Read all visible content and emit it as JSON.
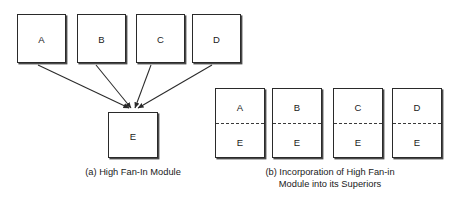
{
  "figure": {
    "background_color": "#ffffff",
    "line_color": "#2a2a2a",
    "panel_a": {
      "caption": "(a) High Fan-In Module",
      "superior_nodes": [
        {
          "label": "A"
        },
        {
          "label": "B"
        },
        {
          "label": "C"
        },
        {
          "label": "D"
        }
      ],
      "fan_in_node": {
        "label": "E"
      },
      "edges": [
        {
          "from": "A",
          "to": "E",
          "arrow": true
        },
        {
          "from": "B",
          "to": "E",
          "arrow": true
        },
        {
          "from": "C",
          "to": "E",
          "arrow": true
        },
        {
          "from": "D",
          "to": "E",
          "arrow": true
        }
      ]
    },
    "panel_b": {
      "caption": "(b) Incorporation of High Fan-in\nModule into its Superiors",
      "merged_nodes": [
        {
          "upper": "A",
          "lower": "E"
        },
        {
          "upper": "B",
          "lower": "E"
        },
        {
          "upper": "C",
          "lower": "E"
        },
        {
          "upper": "D",
          "lower": "E"
        }
      ],
      "divider_style": "dashed"
    }
  }
}
